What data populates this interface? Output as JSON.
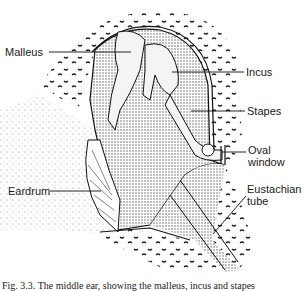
{
  "figure": {
    "labels": {
      "malleus": "Malleus",
      "incus": "Incus",
      "stapes": "Stapes",
      "oval_window_1": "Oval",
      "oval_window_2": "window",
      "eardrum": "Eardrum",
      "eustachian_1": "Eustachian",
      "eustachian_2": "tube"
    },
    "caption": "Fig. 3.3. The middle ear, showing the malleus, incus and stapes"
  }
}
